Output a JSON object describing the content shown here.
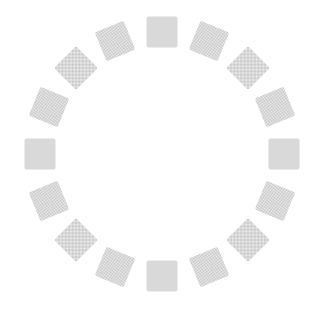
{
  "page": {
    "width_px": 322,
    "height_px": 316,
    "background_color": "#ffffff"
  },
  "spinner": {
    "name": "loading-spinner",
    "segment_shape": "square",
    "segment_count": 16,
    "segment_size_px": 31,
    "corner_radius_px": 2,
    "center_x_px": 162,
    "center_y_px": 154,
    "radius_px": 122,
    "segment_angles_deg": [
      0,
      22.5,
      45,
      67.5,
      90,
      112.5,
      135,
      157.5,
      180,
      202.5,
      225,
      247.5,
      270,
      292.5,
      315,
      337.5
    ],
    "segment_fill_color": "#bdbdbd",
    "segment_dither_color": "#f4f4f4",
    "dither_cell_px": 2
  }
}
